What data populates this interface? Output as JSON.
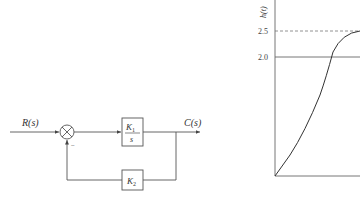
{
  "block_diagram": {
    "input_label": "R(s)",
    "output_label": "C(s)",
    "forward_block": {
      "numerator": "K",
      "numerator_sub": "1",
      "denominator": "s"
    },
    "feedback_block": {
      "label": "K",
      "label_sub": "2"
    },
    "feedback_sign": "−"
  },
  "response_plot": {
    "ylabel": "h(t)",
    "yticks": [
      "2.5",
      "2.0"
    ],
    "peak_value": 2.5,
    "steady_value": 2.0
  }
}
